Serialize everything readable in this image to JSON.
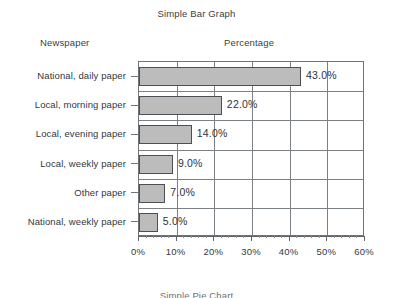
{
  "document": {
    "title": "Simple Bar Graph",
    "next_chart_caption": "Simple Pie Chart"
  },
  "headers": {
    "category": "Newspaper",
    "value": "Percentage"
  },
  "chart_data": {
    "type": "bar",
    "orientation": "horizontal",
    "title": "Simple Bar Graph",
    "xlabel": "Percentage",
    "ylabel": "Newspaper",
    "categories": [
      "National, daily paper",
      "Local, morning paper",
      "Local, evening paper",
      "Local, weekly paper",
      "Other paper",
      "National, weekly paper"
    ],
    "values": [
      43.0,
      22.0,
      14.0,
      9.0,
      7.0,
      5.0
    ],
    "data_labels": [
      "43.0%",
      "22.0%",
      "14.0%",
      "9.0%",
      "7.0%",
      "5.0%"
    ],
    "xlim": [
      0,
      60
    ],
    "xticks": [
      0,
      10,
      20,
      30,
      40,
      50,
      60
    ],
    "xtick_labels": [
      "0%",
      "10%",
      "20%",
      "30%",
      "40%",
      "50%",
      "60%"
    ],
    "minor_ticks_per_interval": 5,
    "grid": "vertical-and-horizontal",
    "legend": "none",
    "bar_color": "#bcbcbc",
    "bar_edge_color": "#4c5054",
    "axis_color": "#6f7478",
    "background": "#ffffff"
  }
}
